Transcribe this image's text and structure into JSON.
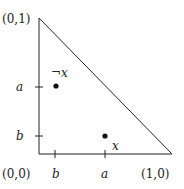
{
  "diagram": {
    "corners": {
      "top": "(0,1)",
      "origin": "(0,0)",
      "right": "(1,0)"
    },
    "y_ticks": [
      {
        "label": "a"
      },
      {
        "label": "b"
      }
    ],
    "x_ticks": [
      {
        "label": "b"
      },
      {
        "label": "a"
      }
    ],
    "points": [
      {
        "label": "¬x",
        "coords": "(b,a)"
      },
      {
        "label": "x",
        "coords": "(a,b)"
      }
    ],
    "colors": {
      "stroke": "#222222",
      "background": "#ffffff"
    }
  }
}
